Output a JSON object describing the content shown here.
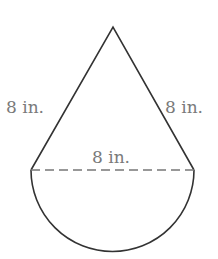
{
  "figure": {
    "labels": {
      "left_side": "8 in.",
      "right_side": "8 in.",
      "diameter": "8 in."
    },
    "colors": {
      "stroke": "#333333",
      "dashed": "#777777",
      "label": "#7a7a7a"
    }
  }
}
